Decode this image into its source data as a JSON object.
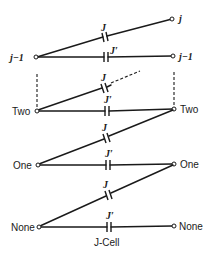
{
  "diagram": {
    "title": "J-Cell",
    "levels": [
      {
        "left_label": "j-1",
        "right_label": "j-1",
        "top_right_label": "j"
      },
      {
        "left_label": "Two",
        "right_label": "Two"
      },
      {
        "left_label": "One",
        "right_label": "One"
      },
      {
        "left_label": "None",
        "right_label": "None"
      }
    ],
    "coupling_labels": {
      "diagonal": "J",
      "horizontal": "J′"
    },
    "cell_caption": "J-Cell",
    "labels": {
      "top_j": "j",
      "jm1_left": "j−1",
      "jm1_right": "j−1",
      "two_left": "Two",
      "two_right": "Two",
      "one_left": "One",
      "one_right": "One",
      "none_left": "None",
      "none_right": "None",
      "J_1": "J",
      "Jp_1": "J′",
      "J_2": "J",
      "Jp_2": "J′",
      "J_3": "J",
      "Jp_3": "J′",
      "J_4": "J",
      "Jp_4": "J′"
    }
  }
}
